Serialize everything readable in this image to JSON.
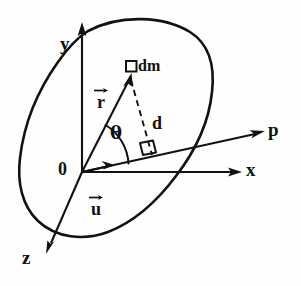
{
  "figure": {
    "background_color": "#fefefe",
    "ink_color": "#111111"
  },
  "axes": [
    {
      "id": "y",
      "label": "y",
      "direction": "up",
      "label_x": 60,
      "label_y": 34
    },
    {
      "id": "x",
      "label": "x",
      "direction": "right",
      "label_x": 246,
      "label_y": 160
    },
    {
      "id": "z",
      "label": "z",
      "direction": "down-left",
      "label_x": 22,
      "label_y": 248
    },
    {
      "id": "p",
      "label": "p",
      "direction": "up-right",
      "label_x": 268,
      "label_y": 120
    }
  ],
  "origin": {
    "label": "0",
    "label_x": 58,
    "label_y": 160,
    "point_x": 82,
    "point_y": 172
  },
  "vectors": [
    {
      "id": "r",
      "label": "r",
      "accent": "arrow",
      "label_x": 93,
      "label_y": 86,
      "from": "origin",
      "to": "dm"
    },
    {
      "id": "u",
      "label": "u",
      "accent": "arrow",
      "label_x": 88,
      "label_y": 193,
      "from": "origin",
      "to": "unit-along-p"
    }
  ],
  "annotations": [
    {
      "id": "dm",
      "label": "dm",
      "marker": "small-square",
      "label_x": 138,
      "label_y": 58
    },
    {
      "id": "d",
      "label": "d",
      "marker": "dashed-line",
      "label_x": 152,
      "label_y": 114
    },
    {
      "id": "theta",
      "label": "θ",
      "marker": "angle-arc",
      "label_x": 110,
      "label_y": 124
    },
    {
      "id": "right-angle",
      "label": "",
      "marker": "right-angle-square",
      "label_x": 143,
      "label_y": 146
    }
  ],
  "body": {
    "name": "rigid-body-outline",
    "shape": "closed-blob"
  }
}
